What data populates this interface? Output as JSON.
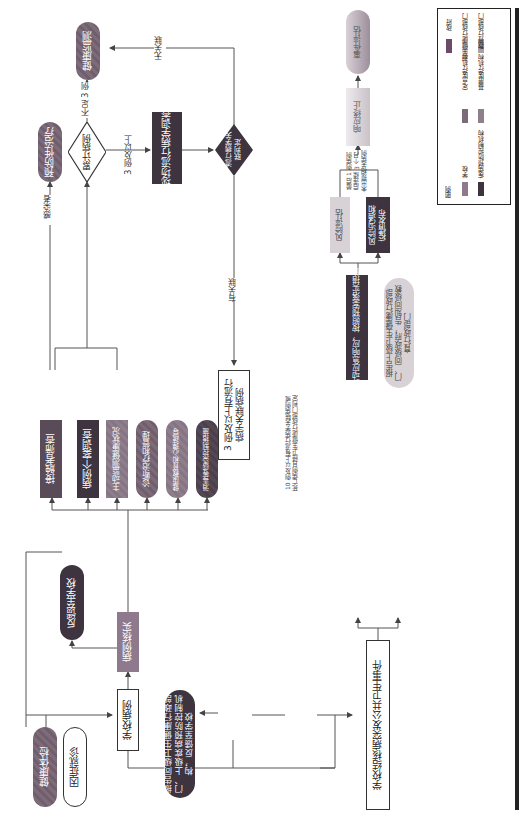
{
  "diagram": {
    "orientation": "rotated-90-ccw",
    "sources": {
      "health_checkup": "健康体检",
      "symptom_visit": "因症就诊"
    },
    "school_case": "学校病例",
    "case_verification": "病例核实",
    "feedback_school": "反馈至学校",
    "actions": [
      "接触者筛查",
      "病例个案调查",
      "主动监测健康状况",
      "诊断治疗和管理",
      "健康教育和心理疏导",
      "消毒等感染控制措施"
    ],
    "infected_label": "感染者",
    "preventive_treatment": "预防性治疗",
    "cumulative_cases": "累计病例",
    "less_than_3": "不足 3 例",
    "health_monitoring": "健康监测",
    "three_or_more": "3 例及以上",
    "field_investigation": "现场流行病学调查",
    "epi_judgment": "流行病学关联判定",
    "not_related": "无关联",
    "related": "有关联",
    "three_linked_cases": "3 例及以上有流行病学关联病例",
    "report_same_level": "报告同级卫生健康行政部门、上级疾病预防控制机构，反馈至学校",
    "ten_or_more_note": "10 例及以上有流行病学关联病例或死亡病例且经卫生健康行政部门判定",
    "public_health_event": "学校结核病突发公共卫生事件",
    "start_emergency": "启动应急响应，按照预案落实措施",
    "report_upper": "报告上级卫生健康行政部门、同级政府，告知同级教育行政部门",
    "risk_assessment": "风险评估",
    "risk_communication": "风险沟通和疫情发布",
    "termination_condition": "最后 1 例病例后连续 3 个月未出现相关病例",
    "response_termination": "响应终止",
    "event_evaluation": "事件评估"
  },
  "legend": {
    "title": "图例",
    "items": [
      {
        "label": "学校",
        "color": "#8e7a8c"
      },
      {
        "label": "疾病预防控制机构",
        "color": "#3d3440"
      },
      {
        "label": "定点医疗机构",
        "color": "#7d6b7a"
      },
      {
        "label": "基层医疗机构",
        "color": "#8f7f8c"
      },
      {
        "label": "政府",
        "color": "#6b4a6a"
      },
      {
        "label": "卫生健康行政部门",
        "color": "#d8d2d6"
      },
      {
        "label": "教育行政部门",
        "color": "#a8a0a6"
      }
    ]
  }
}
